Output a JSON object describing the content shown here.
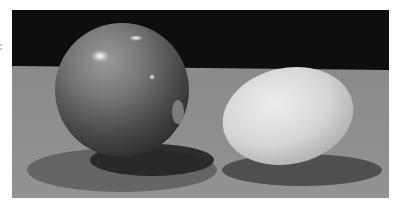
{
  "image": {
    "subject": "A glossy sphere and a white egg resting on a grey surface against a black background",
    "objects": [
      {
        "name": "sphere",
        "tone": "mid-grey, glossy with specular highlights"
      },
      {
        "name": "egg",
        "tone": "light grey / white, matte"
      }
    ],
    "colors": {
      "background": "#101010",
      "table": "#8e8e8e",
      "sphere_mid": "#6e6e6e",
      "sphere_dark": "#2e2e2e",
      "egg_light": "#e2e2e2",
      "egg_shade": "#a8a8a8",
      "shadow": "#3a3a3a",
      "frame": "#ffffff"
    }
  }
}
